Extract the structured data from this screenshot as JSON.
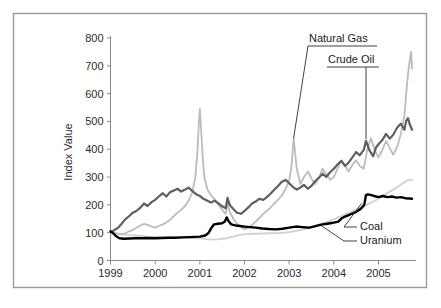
{
  "chart_data": {
    "type": "line",
    "title": "",
    "xlabel": "",
    "ylabel": "Index Value",
    "xlim": [
      1999.0,
      2005.75
    ],
    "ylim": [
      0,
      800
    ],
    "grid": false,
    "legend_position": "inline-annotations",
    "x_tick_labels": [
      "1999",
      "2000",
      "2001",
      "2002",
      "2003",
      "2004",
      "2005"
    ],
    "x_tick_values": [
      1999,
      2000,
      2001,
      2002,
      2003,
      2004,
      2005
    ],
    "y_tick_labels": [
      "0",
      "100",
      "200",
      "300",
      "400",
      "500",
      "600",
      "700",
      "800"
    ],
    "y_tick_values": [
      0,
      100,
      200,
      300,
      400,
      500,
      600,
      700,
      800
    ],
    "annotations": [
      {
        "text": "Natural Gas",
        "points_to_series": "Natural Gas",
        "points_to_x": 2003.1,
        "points_to_y": 440
      },
      {
        "text": "Crude Oil",
        "points_to_series": "Crude Oil",
        "points_to_x": 2004.72,
        "points_to_y": 437
      },
      {
        "text": "Coal",
        "points_to_series": "Coal",
        "points_to_x": 2004.62,
        "points_to_y": 205
      },
      {
        "text": "Uranium",
        "points_to_series": "Uranium",
        "points_to_x": 2003.72,
        "points_to_y": 125
      }
    ],
    "series": [
      {
        "name": "Natural Gas",
        "color": "#bcbcbc",
        "width": 1.8,
        "x": [
          1999.0,
          1999.08,
          1999.17,
          1999.25,
          1999.33,
          1999.42,
          1999.5,
          1999.58,
          1999.67,
          1999.75,
          1999.83,
          1999.92,
          2000.0,
          2000.08,
          2000.17,
          2000.25,
          2000.33,
          2000.42,
          2000.5,
          2000.58,
          2000.67,
          2000.75,
          2000.83,
          2000.9,
          2000.95,
          2000.98,
          2001.0,
          2001.03,
          2001.06,
          2001.1,
          2001.17,
          2001.25,
          2001.33,
          2001.42,
          2001.5,
          2001.58,
          2001.62,
          2001.67,
          2001.75,
          2001.83,
          2001.92,
          2002.0,
          2002.08,
          2002.17,
          2002.25,
          2002.33,
          2002.42,
          2002.5,
          2002.58,
          2002.67,
          2002.75,
          2002.83,
          2002.92,
          2003.0,
          2003.06,
          2003.1,
          2003.17,
          2003.25,
          2003.33,
          2003.42,
          2003.5,
          2003.58,
          2003.67,
          2003.75,
          2003.83,
          2003.92,
          2004.0,
          2004.08,
          2004.17,
          2004.25,
          2004.33,
          2004.42,
          2004.5,
          2004.58,
          2004.67,
          2004.75,
          2004.83,
          2004.92,
          2005.0,
          2005.08,
          2005.17,
          2005.25,
          2005.33,
          2005.42,
          2005.5,
          2005.58,
          2005.62,
          2005.66,
          2005.7,
          2005.73,
          2005.75
        ],
        "y": [
          103,
          99,
          96,
          94,
          98,
          105,
          110,
          118,
          126,
          132,
          128,
          122,
          118,
          124,
          130,
          137,
          146,
          160,
          172,
          182,
          196,
          215,
          245,
          300,
          400,
          500,
          545,
          470,
          380,
          300,
          255,
          235,
          220,
          200,
          182,
          168,
          205,
          175,
          150,
          132,
          120,
          112,
          118,
          128,
          140,
          152,
          168,
          178,
          190,
          205,
          218,
          232,
          258,
          285,
          350,
          440,
          330,
          275,
          300,
          320,
          295,
          275,
          300,
          330,
          310,
          290,
          300,
          330,
          360,
          340,
          320,
          345,
          360,
          340,
          330,
          400,
          440,
          395,
          370,
          395,
          430,
          405,
          380,
          410,
          455,
          520,
          600,
          670,
          720,
          750,
          690
        ],
        "description": "Light gray line, volatile with major spike in early 2001 to ~545 and a steep final rise to ~750 in late 2005."
      },
      {
        "name": "Crude Oil",
        "color": "#5f5f5f",
        "width": 2.2,
        "x": [
          1999.0,
          1999.08,
          1999.17,
          1999.25,
          1999.33,
          1999.42,
          1999.5,
          1999.58,
          1999.67,
          1999.75,
          1999.83,
          1999.92,
          2000.0,
          2000.08,
          2000.17,
          2000.25,
          2000.33,
          2000.42,
          2000.5,
          2000.58,
          2000.67,
          2000.75,
          2000.83,
          2000.92,
          2001.0,
          2001.08,
          2001.17,
          2001.25,
          2001.33,
          2001.42,
          2001.5,
          2001.58,
          2001.62,
          2001.67,
          2001.75,
          2001.83,
          2001.92,
          2002.0,
          2002.08,
          2002.17,
          2002.25,
          2002.33,
          2002.42,
          2002.5,
          2002.58,
          2002.67,
          2002.75,
          2002.83,
          2002.92,
          2003.0,
          2003.08,
          2003.17,
          2003.25,
          2003.33,
          2003.42,
          2003.5,
          2003.58,
          2003.67,
          2003.75,
          2003.83,
          2003.92,
          2004.0,
          2004.08,
          2004.17,
          2004.25,
          2004.33,
          2004.42,
          2004.5,
          2004.58,
          2004.67,
          2004.72,
          2004.8,
          2004.88,
          2004.95,
          2005.0,
          2005.08,
          2005.17,
          2005.25,
          2005.33,
          2005.42,
          2005.5,
          2005.58,
          2005.62,
          2005.66,
          2005.7,
          2005.75
        ],
        "y": [
          104,
          108,
          118,
          132,
          148,
          160,
          172,
          178,
          190,
          205,
          196,
          210,
          218,
          230,
          242,
          230,
          245,
          252,
          258,
          248,
          255,
          262,
          250,
          238,
          232,
          222,
          215,
          208,
          215,
          205,
          195,
          188,
          225,
          200,
          185,
          172,
          168,
          178,
          190,
          205,
          212,
          222,
          218,
          228,
          240,
          255,
          268,
          282,
          290,
          278,
          265,
          255,
          262,
          272,
          258,
          268,
          285,
          298,
          312,
          300,
          318,
          330,
          345,
          358,
          340,
          352,
          372,
          390,
          378,
          398,
          430,
          395,
          375,
          408,
          418,
          432,
          455,
          438,
          452,
          478,
          492,
          470,
          502,
          512,
          490,
          470
        ],
        "description": "Dark gray line, rises through 2000, dips in 2001-2002, then climbs steadily to ~500 by late 2005."
      },
      {
        "name": "Coal",
        "color": "#000000",
        "width": 2.4,
        "x": [
          1999.0,
          1999.06,
          1999.12,
          1999.2,
          1999.3,
          1999.42,
          1999.55,
          1999.7,
          1999.85,
          2000.0,
          2000.15,
          2000.3,
          2000.45,
          2000.6,
          2000.75,
          2000.9,
          2001.0,
          2001.12,
          2001.2,
          2001.26,
          2001.32,
          2001.4,
          2001.5,
          2001.56,
          2001.6,
          2001.64,
          2001.7,
          2001.8,
          2001.9,
          2002.0,
          2002.12,
          2002.25,
          2002.4,
          2002.55,
          2002.7,
          2002.85,
          2003.0,
          2003.15,
          2003.3,
          2003.45,
          2003.55,
          2003.65,
          2003.75,
          2003.85,
          2003.95,
          2004.0,
          2004.1,
          2004.18,
          2004.25,
          2004.32,
          2004.4,
          2004.5,
          2004.6,
          2004.68,
          2004.72,
          2004.76,
          2004.82,
          2004.9,
          2005.0,
          2005.1,
          2005.2,
          2005.3,
          2005.4,
          2005.5,
          2005.6,
          2005.7,
          2005.75
        ],
        "y": [
          104,
          98,
          88,
          80,
          78,
          79,
          80,
          80,
          81,
          80,
          81,
          82,
          82,
          83,
          84,
          85,
          86,
          90,
          100,
          118,
          130,
          132,
          134,
          140,
          155,
          142,
          130,
          126,
          124,
          122,
          120,
          118,
          115,
          113,
          112,
          114,
          118,
          122,
          120,
          118,
          122,
          126,
          130,
          132,
          135,
          136,
          140,
          152,
          158,
          162,
          168,
          175,
          185,
          200,
          235,
          238,
          236,
          232,
          228,
          232,
          228,
          230,
          226,
          228,
          224,
          223,
          222
        ],
        "description": "Black line, lowest early, gradual rise with step increases, jumping to ~235 in late 2004 then flat near 225."
      },
      {
        "name": "Uranium",
        "color": "#d2d2d2",
        "width": 1.9,
        "x": [
          1999.0,
          1999.1,
          1999.25,
          1999.4,
          1999.55,
          1999.7,
          1999.85,
          2000.0,
          2000.2,
          2000.4,
          2000.6,
          2000.8,
          2001.0,
          2001.1,
          2001.2,
          2001.3,
          2001.4,
          2001.5,
          2001.6,
          2001.7,
          2001.8,
          2001.9,
          2002.0,
          2002.2,
          2002.4,
          2002.6,
          2002.8,
          2003.0,
          2003.2,
          2003.4,
          2003.6,
          2003.8,
          2004.0,
          2004.2,
          2004.4,
          2004.6,
          2004.8,
          2005.0,
          2005.15,
          2005.3,
          2005.4,
          2005.5,
          2005.58,
          2005.65,
          2005.72,
          2005.75
        ],
        "y": [
          100,
          98,
          95,
          92,
          90,
          88,
          86,
          85,
          84,
          83,
          82,
          81,
          80,
          78,
          76,
          75,
          76,
          78,
          80,
          84,
          88,
          92,
          95,
          96,
          97,
          98,
          99,
          102,
          108,
          116,
          126,
          136,
          148,
          162,
          176,
          190,
          205,
          222,
          238,
          252,
          262,
          272,
          282,
          288,
          290,
          290
        ],
        "description": "Palest gray line, declines to ~75 in 2001 then rises steadily to ~290 by late 2005."
      }
    ]
  }
}
